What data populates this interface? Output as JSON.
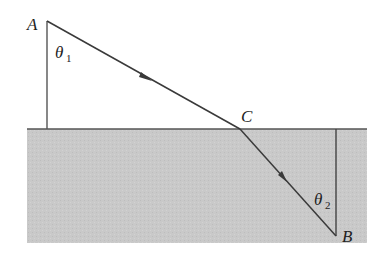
{
  "diagram": {
    "points": {
      "A": {
        "label": "A",
        "x": 47,
        "y": 21
      },
      "C": {
        "label": "C",
        "x": 240,
        "y": 129
      },
      "B": {
        "label": "B",
        "x": 336,
        "y": 236
      }
    },
    "angles": {
      "theta1": {
        "symbol": "θ",
        "subscript": "1"
      },
      "theta2": {
        "symbol": "θ",
        "subscript": "2"
      }
    },
    "media": {
      "upper": {
        "color": "#ffffff"
      },
      "lower": {
        "color": "#c8c8c8"
      }
    },
    "colors": {
      "line": "#444444",
      "ray": "#3a3a3a"
    }
  }
}
